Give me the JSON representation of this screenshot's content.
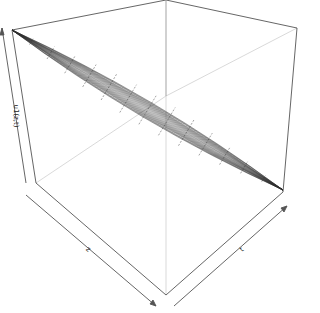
{
  "chart_data": {
    "type": "surface3d",
    "title": "",
    "xlabel": "z",
    "ylabel": "t",
    "zlabel": "u1(z,t)",
    "grid": false,
    "box": true,
    "ticks": false,
    "surface_color": "#333333",
    "box_color": "#555555"
  },
  "labels": {
    "x_axis": "z",
    "y_axis": "t",
    "z_axis": "u1(z,t)"
  }
}
